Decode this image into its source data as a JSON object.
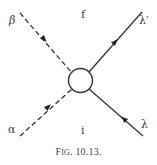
{
  "figure": {
    "caption_prefix_big": "F",
    "caption_prefix_small": "IG",
    "caption_rest": ". 10.13.",
    "region_labels": {
      "top": "f",
      "bottom": "i"
    },
    "external_lines": [
      {
        "id": "beta",
        "label": "β",
        "style": "dashed",
        "arrow": "toward-vertex"
      },
      {
        "id": "alpha",
        "label": "α",
        "style": "dashed",
        "arrow": "toward-vertex"
      },
      {
        "id": "lambda-prime",
        "label": "λ′",
        "style": "solid",
        "arrow": "away-from-vertex"
      },
      {
        "id": "lambda",
        "label": "λ",
        "style": "solid",
        "arrow": "toward-vertex"
      }
    ],
    "vertex": {
      "shape": "circle",
      "fill": "none"
    },
    "colors": {
      "line": "#333333",
      "background": "#ffffff"
    }
  }
}
